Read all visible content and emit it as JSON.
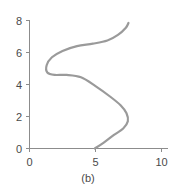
{
  "chart_data": {
    "type": "line",
    "title": "",
    "subtitle": "",
    "caption": "(b)",
    "xlabel": "",
    "ylabel": "",
    "xlim": [
      0,
      10
    ],
    "ylim": [
      0,
      8
    ],
    "grid": false,
    "legend": null,
    "xticks": [
      0,
      5,
      10
    ],
    "xtick_labels": [
      "0",
      "5",
      "10"
    ],
    "yticks": [
      0,
      2,
      4,
      6,
      8
    ],
    "ytick_labels": [
      "0",
      "2",
      "4",
      "6",
      "8"
    ],
    "series": [
      {
        "name": "curve",
        "color": "#9a9a9a",
        "line_width": 2.2,
        "shape": "s-curve",
        "points": [
          {
            "x": 4.95,
            "y": 0.0
          },
          {
            "x": 5.6,
            "y": 0.35
          },
          {
            "x": 6.4,
            "y": 0.85
          },
          {
            "x": 7.1,
            "y": 1.25
          },
          {
            "x": 7.45,
            "y": 1.7
          },
          {
            "x": 7.35,
            "y": 2.2
          },
          {
            "x": 6.9,
            "y": 2.7
          },
          {
            "x": 6.1,
            "y": 3.25
          },
          {
            "x": 5.0,
            "y": 3.9
          },
          {
            "x": 3.9,
            "y": 4.45
          },
          {
            "x": 2.8,
            "y": 4.6
          },
          {
            "x": 1.9,
            "y": 4.6
          },
          {
            "x": 1.35,
            "y": 4.75
          },
          {
            "x": 1.3,
            "y": 5.2
          },
          {
            "x": 1.7,
            "y": 5.7
          },
          {
            "x": 2.5,
            "y": 6.1
          },
          {
            "x": 3.6,
            "y": 6.4
          },
          {
            "x": 4.8,
            "y": 6.55
          },
          {
            "x": 5.9,
            "y": 6.75
          },
          {
            "x": 6.7,
            "y": 7.1
          },
          {
            "x": 7.3,
            "y": 7.55
          },
          {
            "x": 7.5,
            "y": 7.85
          }
        ]
      }
    ]
  },
  "axes": {
    "x_axis_name": "x-axis",
    "y_axis_name": "y-axis"
  },
  "colors": {
    "curve": "#9a9a9a",
    "axis": "#8c8c8c",
    "text": "#4a4a4a",
    "background": "#ffffff"
  }
}
